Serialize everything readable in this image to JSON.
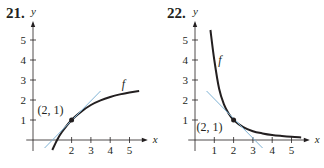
{
  "chart_data": [
    {
      "type": "line",
      "problem_number": "21.",
      "title": "",
      "xlabel": "x",
      "ylabel": "y",
      "xlim": [
        -0.3,
        5.8
      ],
      "ylim": [
        -0.6,
        5.8
      ],
      "x_ticks": [
        "2",
        "3",
        "4",
        "5"
      ],
      "y_ticks": [
        "1",
        "2",
        "3",
        "4",
        "5"
      ],
      "grid": false,
      "series": [
        {
          "name": "f",
          "kind": "curve",
          "color": "#231f20",
          "x": [
            1.0,
            1.25,
            1.5,
            2.0,
            2.5,
            3.0,
            3.5,
            4.0,
            4.5,
            5.0,
            5.5
          ],
          "y": [
            -0.5,
            0.0,
            0.4,
            1.0,
            1.42,
            1.75,
            1.98,
            2.15,
            2.28,
            2.38,
            2.45
          ]
        },
        {
          "name": "tangent line",
          "kind": "line",
          "color": "#7fb3d5",
          "x": [
            0.6,
            3.5
          ],
          "y": [
            -0.4,
            2.45
          ]
        }
      ],
      "annotations": [
        {
          "text": "(2, 1)",
          "x": 2,
          "y": 1,
          "marker": "point"
        },
        {
          "text": "f",
          "x": 4.6,
          "y": 2.6
        }
      ]
    },
    {
      "type": "line",
      "problem_number": "22.",
      "title": "",
      "xlabel": "x",
      "ylabel": "y",
      "xlim": [
        -0.3,
        5.8
      ],
      "ylim": [
        -0.6,
        5.8
      ],
      "x_ticks": [
        "1",
        "2",
        "3",
        "4",
        "5"
      ],
      "y_ticks": [
        "1",
        "2",
        "3",
        "4",
        "5"
      ],
      "grid": false,
      "series": [
        {
          "name": "f",
          "kind": "curve",
          "color": "#231f20",
          "x": [
            0.8,
            1.0,
            1.25,
            1.5,
            1.75,
            2.0,
            2.5,
            3.0,
            3.5,
            4.0,
            4.5,
            5.0,
            5.5
          ],
          "y": [
            5.5,
            4.0,
            2.56,
            1.78,
            1.31,
            1.0,
            0.64,
            0.44,
            0.33,
            0.25,
            0.2,
            0.16,
            0.13
          ]
        },
        {
          "name": "tangent line",
          "kind": "line",
          "color": "#7fb3d5",
          "x": [
            0.6,
            3.5
          ],
          "y": [
            2.45,
            -0.4
          ]
        }
      ],
      "annotations": [
        {
          "text": "(2, 1)",
          "x": 2,
          "y": 1,
          "marker": "point"
        },
        {
          "text": "f",
          "x": 1.2,
          "y": 3.8
        }
      ]
    }
  ]
}
